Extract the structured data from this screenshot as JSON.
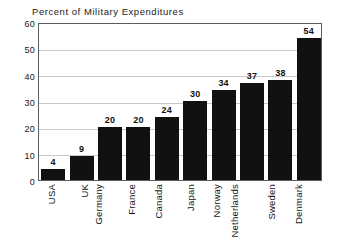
{
  "chart_data": {
    "type": "bar",
    "title": "Percent of Military Expenditures",
    "xlabel": "",
    "ylabel": "",
    "categories": [
      "USA",
      "UK",
      "Germany",
      "France",
      "Canada",
      "Japan",
      "Norway",
      "Netherlands",
      "Sweden",
      "Denmark"
    ],
    "values": [
      4,
      9,
      20,
      20,
      24,
      30,
      34,
      37,
      38,
      54
    ],
    "value_labels": [
      "4",
      "9",
      "20",
      "20",
      "24",
      "30",
      "34",
      "37",
      "38",
      "54"
    ],
    "ylim": [
      0,
      60
    ],
    "ytick_labels": [
      "0",
      "10",
      "20",
      "30",
      "40",
      "50",
      "60"
    ],
    "ytick_values": [
      0,
      10,
      20,
      30,
      40,
      50,
      60
    ],
    "grid": "horizontal",
    "legend": null,
    "bar_color": "#111111",
    "grid_color": "#c9c9c9",
    "frame_color": "#5d5d5d",
    "background_color": "#ffffff",
    "text_color": "#161616"
  }
}
